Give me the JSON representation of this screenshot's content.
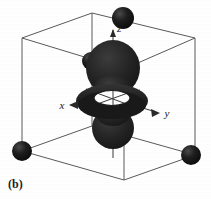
{
  "figure": {
    "caption": "(b)",
    "background_color": "#ffffff"
  },
  "axes": {
    "x": {
      "label": "x",
      "arrow_direction": "left"
    },
    "y": {
      "label": "y",
      "arrow_direction": "right"
    },
    "z": {
      "label": "z",
      "arrow_direction": "up"
    }
  },
  "colors": {
    "cell_edge": "#5a5a5a",
    "atom_sphere": "#161616",
    "atom_sphere_highlight": "#4a4a4a",
    "orbital_lobe": "#262626",
    "orbital_torus": "#1f1f1f",
    "orbital_hole": "#ffffff",
    "axis_line": "#3a3a3a",
    "label_text": "#1a1a1a"
  },
  "cell": {
    "shape": "cube",
    "edge_count": 12,
    "corner_atom_count": 4
  },
  "atoms": [
    {
      "name": "atom-top-back",
      "cx": 123,
      "cy": 18,
      "r": 11
    },
    {
      "name": "atom-left-back",
      "cx": 91,
      "cy": 61,
      "r": 9
    },
    {
      "name": "atom-bottom-left-front",
      "cx": 22,
      "cy": 151,
      "r": 10
    },
    {
      "name": "atom-bottom-right-front",
      "cx": 191,
      "cy": 155,
      "r": 10
    }
  ],
  "orbital": {
    "type": "dz2",
    "top_lobe": {
      "cx": 113,
      "cy": 70,
      "rx": 26,
      "ry": 27
    },
    "bottom_lobe": {
      "cx": 113,
      "cy": 128,
      "rx": 21,
      "ry": 20
    },
    "torus": {
      "cx": 112,
      "cy": 101,
      "rx": 35,
      "ry": 16
    },
    "torus_hole": {
      "cx": 112,
      "cy": 99,
      "rx": 17,
      "ry": 7
    }
  }
}
